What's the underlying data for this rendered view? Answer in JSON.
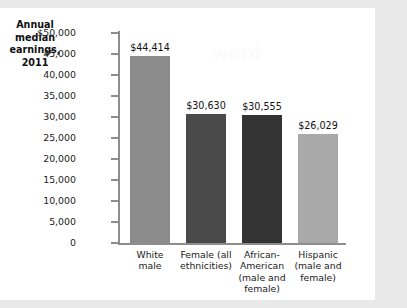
{
  "figure": {
    "title_lines": [
      "Annual",
      "median",
      "earnings,",
      "2011"
    ],
    "watermark": "word",
    "background_color": "#e9e9e9",
    "card_color": "#ffffff",
    "axis_color": "#8d8d8d"
  },
  "chart_data": {
    "type": "bar",
    "title": "Annual median earnings, 2011",
    "xlabel": "",
    "ylabel": "",
    "ylim": [
      0,
      50000
    ],
    "grid": false,
    "legend": "none",
    "categories": [
      "White male",
      "Female (all ethnicities)",
      "African-American (male and female)",
      "Hispanic (male and female)"
    ],
    "category_label_lines": [
      [
        "White",
        "male"
      ],
      [
        "Female (all",
        "ethnicities)"
      ],
      [
        "African-",
        "American",
        "(male and",
        "female)"
      ],
      [
        "Hispanic",
        "(male and",
        "female)"
      ]
    ],
    "values": [
      44414,
      30630,
      30555,
      26029
    ],
    "value_labels": [
      "$44,414",
      "$30,630",
      "$30,555",
      "$26,029"
    ],
    "bar_colors": [
      "#8c8c8c",
      "#4a4a4a",
      "#333333",
      "#a9a9a9"
    ],
    "ytick_values": [
      50000,
      45000,
      40000,
      35000,
      30000,
      25000,
      20000,
      15000,
      10000,
      5000,
      0
    ],
    "ytick_labels": [
      "$50,000",
      "45,000",
      "40,000",
      "35,000",
      "30,000",
      "25,000",
      "20,000",
      "15,000",
      "10,000",
      "5,000",
      "0"
    ]
  }
}
